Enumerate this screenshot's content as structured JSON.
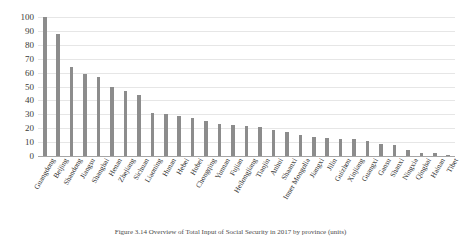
{
  "chart_data": {
    "type": "bar",
    "title": "",
    "xlabel": "",
    "ylabel": "",
    "ylim": [
      0,
      100
    ],
    "ytick_step": 10,
    "grid": "horizontal",
    "legend": "none",
    "bar_color": "#8c8c8c",
    "gridline_color": "#e6e6e6",
    "axis_color": "#a6a6a6",
    "xlabel_rotation": -60,
    "yticks": [
      0,
      10,
      20,
      30,
      40,
      50,
      60,
      70,
      80,
      90,
      100
    ],
    "categories": [
      "Guangdong",
      "Beijing",
      "Shandong",
      "Jiangsu",
      "Shanghai",
      "Henan",
      "Zhejiang",
      "Sichuan",
      "Liaoning",
      "Hunan",
      "Hebei",
      "Hubei",
      "Chongqing",
      "Yunnan",
      "Fujian",
      "Heilongjiang",
      "Tianjin",
      "Anhui",
      "Shaanxi",
      "Inner Mongolia",
      "Jiangxi",
      "Jilin",
      "Guizhou",
      "Xinjiang",
      "Guangxi",
      "Gansu",
      "Shanxi",
      "Ningxia",
      "Qinghai",
      "Hainan",
      "Tibet"
    ],
    "values": [
      100,
      88,
      64,
      59,
      57,
      50,
      47,
      44,
      31,
      30.5,
      29,
      27.5,
      25,
      23,
      22.5,
      21.5,
      21,
      18.5,
      17,
      15,
      14,
      13,
      12.5,
      12,
      11,
      9,
      8,
      4,
      2.5,
      2,
      0.5
    ]
  },
  "caption": {
    "text": "Figure 3.14  Overview of Total Input of Social Security in 2017 by province (units)"
  }
}
